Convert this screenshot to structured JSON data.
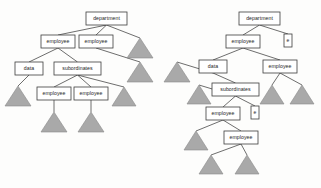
{
  "figure": {
    "name": "xml-tree-pair",
    "background_color": "#fdfdfc",
    "box_fill": "#ffffff",
    "box_stroke": "#3d3d3d",
    "edge_color": "#3d3d3d",
    "triangle_fill": "#a9a9a9",
    "triangle_stroke": "#8a8a8a"
  },
  "labels": {
    "department": "department",
    "employee": "employee",
    "data": "data",
    "subordinates": "subordinates",
    "e": "e"
  },
  "left_tree": {
    "name": "left-tree",
    "nodes": [
      {
        "id": "l-department",
        "label": "department",
        "x": 86,
        "y": 12,
        "w": 41,
        "h": 13
      },
      {
        "id": "l-employee-1",
        "label": "employee",
        "x": 41,
        "y": 35,
        "w": 34,
        "h": 13
      },
      {
        "id": "l-employee-2",
        "label": "employee",
        "x": 79,
        "y": 35,
        "w": 34,
        "h": 13
      },
      {
        "id": "l-data",
        "label": "data",
        "x": 15,
        "y": 62,
        "w": 28,
        "h": 13
      },
      {
        "id": "l-subordinates",
        "label": "subordinates",
        "x": 54,
        "y": 62,
        "w": 47,
        "h": 13
      },
      {
        "id": "l-employee-3",
        "label": "employee",
        "x": 37,
        "y": 87,
        "w": 34,
        "h": 13
      },
      {
        "id": "l-employee-4",
        "label": "employee",
        "x": 74,
        "y": 87,
        "w": 34,
        "h": 13
      }
    ],
    "triangles": [
      {
        "id": "l-tri-1",
        "cx": 140,
        "top": 38,
        "w": 26,
        "h": 20
      },
      {
        "id": "l-tri-2",
        "cx": 140,
        "top": 62,
        "w": 26,
        "h": 20
      },
      {
        "id": "l-tri-3",
        "cx": 124,
        "top": 87,
        "w": 24,
        "h": 19
      },
      {
        "id": "l-tri-4",
        "cx": 18,
        "top": 86,
        "w": 26,
        "h": 20
      },
      {
        "id": "l-tri-5",
        "cx": 54,
        "top": 112,
        "w": 26,
        "h": 20
      },
      {
        "id": "l-tri-6",
        "cx": 91,
        "top": 112,
        "w": 26,
        "h": 20
      }
    ],
    "edges": [
      {
        "from": "l-department",
        "to": "l-employee-1"
      },
      {
        "from": "l-department",
        "to": "l-employee-2"
      },
      {
        "from": "l-department",
        "to": "l-tri-1"
      },
      {
        "from": "l-employee-1",
        "to": "l-data"
      },
      {
        "from": "l-employee-1",
        "to": "l-subordinates"
      },
      {
        "from": "l-employee-2",
        "to": "l-tri-2"
      },
      {
        "from": "l-data",
        "to": "l-tri-4"
      },
      {
        "from": "l-subordinates",
        "to": "l-employee-3"
      },
      {
        "from": "l-subordinates",
        "to": "l-employee-4"
      },
      {
        "from": "l-subordinates",
        "to": "l-tri-3"
      },
      {
        "from": "l-employee-3",
        "to": "l-tri-5"
      },
      {
        "from": "l-employee-4",
        "to": "l-tri-6"
      }
    ]
  },
  "right_tree": {
    "name": "right-tree",
    "nodes": [
      {
        "id": "r-department",
        "label": "department",
        "x": 239,
        "y": 12,
        "w": 41,
        "h": 13
      },
      {
        "id": "r-employee-1",
        "label": "employee",
        "x": 226,
        "y": 35,
        "w": 34,
        "h": 13
      },
      {
        "id": "r-e-1",
        "label": "e",
        "x": 284,
        "y": 34,
        "w": 8,
        "h": 13
      },
      {
        "id": "r-data",
        "label": "data",
        "x": 199,
        "y": 60,
        "w": 28,
        "h": 13
      },
      {
        "id": "r-employee-2",
        "label": "employee",
        "x": 263,
        "y": 60,
        "w": 34,
        "h": 13
      },
      {
        "id": "r-subordinates",
        "label": "subordinates",
        "x": 212,
        "y": 83,
        "w": 47,
        "h": 13
      },
      {
        "id": "r-employee-3",
        "label": "employee",
        "x": 206,
        "y": 107,
        "w": 34,
        "h": 13
      },
      {
        "id": "r-e-2",
        "label": "e",
        "x": 251,
        "y": 106,
        "w": 8,
        "h": 13
      },
      {
        "id": "r-employee-4",
        "label": "employee",
        "x": 224,
        "y": 131,
        "w": 34,
        "h": 13
      }
    ],
    "triangles": [
      {
        "id": "r-tri-1",
        "cx": 177,
        "top": 62,
        "w": 26,
        "h": 20
      },
      {
        "id": "r-tri-2",
        "cx": 199,
        "top": 85,
        "w": 24,
        "h": 19
      },
      {
        "id": "r-tri-3",
        "cx": 272,
        "top": 85,
        "w": 24,
        "h": 19
      },
      {
        "id": "r-tri-4",
        "cx": 302,
        "top": 85,
        "w": 24,
        "h": 19
      },
      {
        "id": "r-tri-5",
        "cx": 196,
        "top": 131,
        "w": 24,
        "h": 19
      },
      {
        "id": "r-tri-6",
        "cx": 211,
        "top": 155,
        "w": 24,
        "h": 19
      },
      {
        "id": "r-tri-7",
        "cx": 247,
        "top": 155,
        "w": 24,
        "h": 19
      }
    ],
    "edges": [
      {
        "from": "r-department",
        "to": "r-employee-1"
      },
      {
        "from": "r-department",
        "to": "r-e-1"
      },
      {
        "from": "r-employee-1",
        "to": "r-data"
      },
      {
        "from": "r-employee-1",
        "to": "r-employee-2"
      },
      {
        "from": "r-data",
        "to": "r-tri-1"
      },
      {
        "from": "r-data",
        "to": "r-subordinates"
      },
      {
        "from": "r-employee-2",
        "to": "r-tri-3"
      },
      {
        "from": "r-employee-2",
        "to": "r-tri-4"
      },
      {
        "from": "r-subordinates",
        "to": "r-tri-2"
      },
      {
        "from": "r-subordinates",
        "to": "r-employee-3"
      },
      {
        "from": "r-subordinates",
        "to": "r-e-2"
      },
      {
        "from": "r-employee-3",
        "to": "r-tri-5"
      },
      {
        "from": "r-employee-3",
        "to": "r-employee-4"
      },
      {
        "from": "r-employee-4",
        "to": "r-tri-6"
      },
      {
        "from": "r-employee-4",
        "to": "r-tri-7"
      }
    ]
  }
}
